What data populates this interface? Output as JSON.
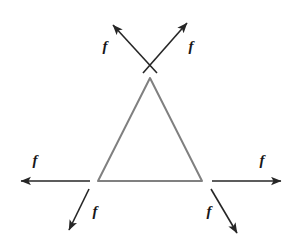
{
  "figure": {
    "name": "equilateral-triangle-with-six-force-vectors",
    "canvas": {
      "width": 295,
      "height": 250
    },
    "background_color": "#ffffff"
  },
  "shape": {
    "name": "triangle",
    "type": "equilateral-triangle",
    "stroke_color": "#808080",
    "stroke_width": 2,
    "fill": "none",
    "vertices": {
      "apex": {
        "x": 150,
        "y": 78
      },
      "bottom_left": {
        "x": 98,
        "y": 181
      },
      "bottom_right": {
        "x": 202,
        "y": 181
      }
    }
  },
  "arrow_style": {
    "stroke_color": "#262626",
    "stroke_width": 1.6,
    "head_length": 8,
    "head_width": 6
  },
  "arrows": [
    {
      "id": "apex-upper-left",
      "label": "f",
      "origin": {
        "x": 157,
        "y": 73
      },
      "tip": {
        "x": 113,
        "y": 25
      },
      "label_pos": {
        "x": 105,
        "y": 48
      }
    },
    {
      "id": "apex-upper-right",
      "label": "f",
      "origin": {
        "x": 143,
        "y": 73
      },
      "tip": {
        "x": 187,
        "y": 23
      },
      "label_pos": {
        "x": 191,
        "y": 48
      }
    },
    {
      "id": "bottom-left-horizontal",
      "label": "f",
      "origin": {
        "x": 90,
        "y": 181
      },
      "tip": {
        "x": 21,
        "y": 181
      },
      "label_pos": {
        "x": 35,
        "y": 162
      }
    },
    {
      "id": "bottom-right-horizontal",
      "label": "f",
      "origin": {
        "x": 212,
        "y": 181
      },
      "tip": {
        "x": 281,
        "y": 181
      },
      "label_pos": {
        "x": 262,
        "y": 162
      }
    },
    {
      "id": "bottom-left-diagonal",
      "label": "f",
      "origin": {
        "x": 89,
        "y": 189
      },
      "tip": {
        "x": 69,
        "y": 230
      },
      "label_pos": {
        "x": 95,
        "y": 213
      }
    },
    {
      "id": "bottom-right-diagonal",
      "label": "f",
      "origin": {
        "x": 211,
        "y": 189
      },
      "tip": {
        "x": 237,
        "y": 233
      },
      "label_pos": {
        "x": 209,
        "y": 213
      }
    }
  ],
  "labels": {
    "force_symbol": "f"
  }
}
